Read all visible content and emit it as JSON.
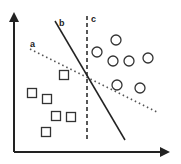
{
  "diagram": {
    "colors": {
      "stroke": "#222222",
      "background": "#ffffff"
    },
    "axes": {
      "y": {
        "x1": 14,
        "y1": 152,
        "x2": 14,
        "y2": 14
      },
      "x": {
        "x1": 14,
        "y1": 152,
        "x2": 168,
        "y2": 152
      }
    },
    "lines": [
      {
        "id": "a",
        "label": "a",
        "style": "dotted",
        "x1": 30,
        "y1": 49,
        "x2": 157,
        "y2": 112,
        "label_x": 30,
        "label_y": 47
      },
      {
        "id": "b",
        "label": "b",
        "style": "solid",
        "x1": 55,
        "y1": 21,
        "x2": 125,
        "y2": 140,
        "label_x": 59,
        "label_y": 26
      },
      {
        "id": "c",
        "label": "c",
        "style": "dashed",
        "x1": 87,
        "y1": 16,
        "x2": 87,
        "y2": 142,
        "label_x": 91,
        "label_y": 22
      }
    ],
    "squares": [
      {
        "x": 64,
        "y": 75
      },
      {
        "x": 32,
        "y": 93
      },
      {
        "x": 47,
        "y": 99
      },
      {
        "x": 56,
        "y": 116
      },
      {
        "x": 71,
        "y": 117
      },
      {
        "x": 46,
        "y": 132
      }
    ],
    "circles": [
      {
        "x": 116,
        "y": 40
      },
      {
        "x": 97,
        "y": 52
      },
      {
        "x": 113,
        "y": 61
      },
      {
        "x": 129,
        "y": 61
      },
      {
        "x": 148,
        "y": 58
      },
      {
        "x": 117,
        "y": 85
      },
      {
        "x": 140,
        "y": 88
      }
    ]
  }
}
